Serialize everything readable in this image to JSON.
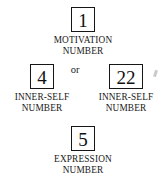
{
  "diagram": {
    "type": "numerology-core-numbers",
    "connector_label": "or",
    "nodes": [
      {
        "id": "motivation",
        "value": "1",
        "caption": "MOTIVATION\nNUMBER",
        "caption_line1": "MOTIVATION",
        "caption_line2": "NUMBER"
      },
      {
        "id": "inner-self-left",
        "value": "4",
        "caption": "INNER-SELF\nNUMBER",
        "caption_line1": "INNER-SELF",
        "caption_line2": "NUMBER"
      },
      {
        "id": "inner-self-right",
        "value": "22",
        "caption": "INNER-SELF\nNUMBER",
        "caption_line1": "INNER-SELF",
        "caption_line2": "NUMBER"
      },
      {
        "id": "expression",
        "value": "5",
        "caption": "EXPRESSION\nNUMBER",
        "caption_line1": "EXPRESSION",
        "caption_line2": "NUMBER"
      }
    ],
    "colors": {
      "background": "#ffffff",
      "box_border": "#161616",
      "text": "#191919"
    }
  }
}
